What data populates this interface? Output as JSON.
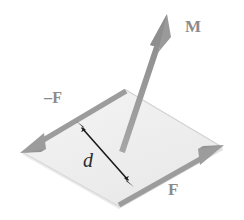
{
  "figure": {
    "background_color": "#ffffff"
  },
  "colors": {
    "arrow_gray": "#9a9a9a",
    "arrow_gray_dark": "#8a8a8a",
    "plane_fill": "#f1f1f1",
    "plane_edge": "#cfcfcf",
    "dimension_arrow": "#1c1c1c",
    "label_gray": "#8b8b8b",
    "label_dark": "#2b2b2b"
  },
  "labels": {
    "moment": "M",
    "force_negative": "–F",
    "force_positive": "F",
    "distance": "d"
  },
  "geometry": {
    "plane_vertices": [
      {
        "name": "top",
        "x": 126,
        "y": 90
      },
      {
        "name": "right",
        "x": 222,
        "y": 147
      },
      {
        "name": "bottom",
        "x": 118,
        "y": 206
      },
      {
        "name": "left",
        "x": 22,
        "y": 152
      }
    ],
    "moment_vector": {
      "x1": 122,
      "y1": 152,
      "x2": 166,
      "y2": 18
    },
    "force_negative_vector": {
      "x1": 124,
      "y1": 92,
      "x2": 22,
      "y2": 152
    },
    "force_positive_vector": {
      "x1": 120,
      "y1": 204,
      "x2": 222,
      "y2": 146
    },
    "distance_arrow": {
      "x1": 77,
      "y1": 122,
      "x2": 133,
      "y2": 186
    }
  }
}
